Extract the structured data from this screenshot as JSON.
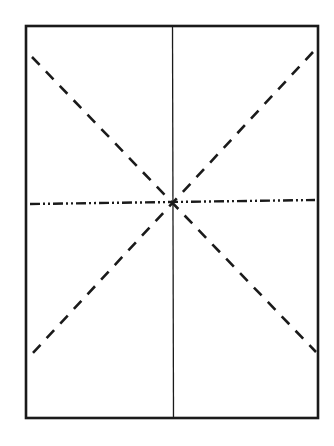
{
  "diagram": {
    "canvas": {
      "width": 334,
      "height": 446,
      "background": "#ffffff"
    },
    "stroke_color": "#1a1a1a",
    "frame": {
      "x1": 26,
      "y1": 26,
      "x2": 318,
      "y2": 418,
      "stroke_width": 2.6,
      "style": "solid"
    },
    "vertical_center_line": {
      "x1": 172.5,
      "y1": 26,
      "x2": 173.5,
      "y2": 418,
      "stroke_width": 1.3,
      "style": "solid"
    },
    "diagonal_descending": {
      "x1": 32,
      "y1": 57,
      "x2": 316,
      "y2": 352,
      "stroke_width": 2.6,
      "style": "dashed",
      "dash": "11 9"
    },
    "diagonal_ascending": {
      "x1": 313,
      "y1": 52,
      "x2": 31,
      "y2": 355,
      "stroke_width": 2.6,
      "style": "dashed",
      "dash": "11 9"
    },
    "horizontal_line": {
      "x1": 30,
      "y1": 204,
      "x2": 315,
      "y2": 200,
      "stroke_width": 2.4,
      "style": "dash-dot-dot",
      "dash": "10 3 2 3 2 3"
    },
    "intersection": {
      "x": 173,
      "y": 202
    }
  }
}
